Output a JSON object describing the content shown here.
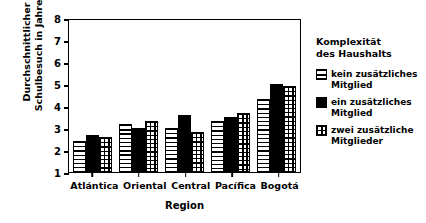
{
  "chart_data": {
    "type": "bar",
    "title": "",
    "xlabel": "Region",
    "ylabel_line1": "Durchschnittlicher",
    "ylabel_line2": "Schulbesuch in Jahren",
    "categories": [
      "Atlántica",
      "Oriental",
      "Central",
      "Pacífica",
      "Bogotá"
    ],
    "series": [
      {
        "name": "kein zusätzliches Mitglied",
        "pattern": "horizontal-lines",
        "values": [
          2.4,
          3.2,
          3.0,
          3.3,
          4.3
        ]
      },
      {
        "name": "ein zusätzliches Mitglied",
        "pattern": "solid-black",
        "values": [
          2.7,
          3.0,
          3.6,
          3.5,
          5.0
        ]
      },
      {
        "name": "zwei zusätzliche Mitglieder",
        "pattern": "grid",
        "values": [
          2.6,
          3.3,
          2.8,
          3.7,
          4.9
        ]
      }
    ],
    "ylim": [
      1,
      8
    ],
    "yticks": [
      1,
      2,
      3,
      4,
      5,
      6,
      7,
      8
    ],
    "ytick_labels": [
      "1",
      "2",
      "3",
      "4",
      "5",
      "6",
      "7",
      "8"
    ],
    "grid": false,
    "legend_position": "right"
  },
  "legend": {
    "title_line1": "Komplexität",
    "title_line2": "des Haushalts",
    "items": [
      {
        "label_line1": "kein zusätzliches",
        "label_line2": "Mitglied"
      },
      {
        "label_line1": "ein zusätzliches",
        "label_line2": "Mitglied"
      },
      {
        "label_line1": "zwei zusätzliche",
        "label_line2": "Mitglieder"
      }
    ]
  },
  "colors": {
    "ink": "#000000",
    "background": "#ffffff"
  }
}
